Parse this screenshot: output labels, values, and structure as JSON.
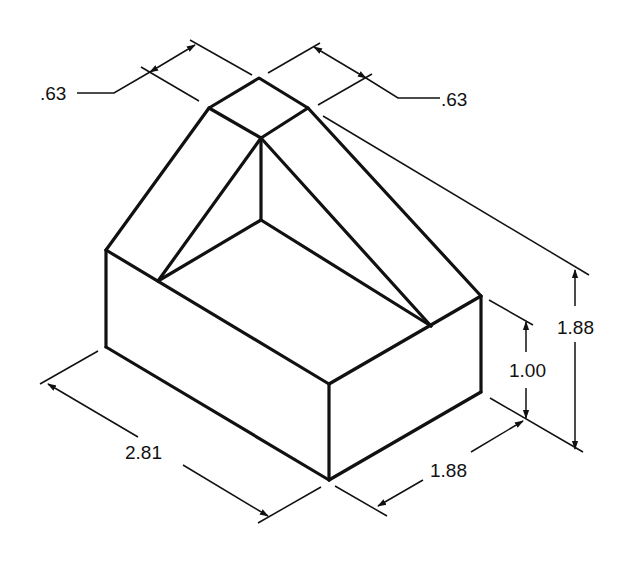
{
  "diagram": {
    "type": "isometric-technical-drawing",
    "line_color": "#111111",
    "background": "#ffffff",
    "dimensions": [
      {
        "id": "top-left-width",
        "label": ".63"
      },
      {
        "id": "top-right-width",
        "label": ".63"
      },
      {
        "id": "overall-height",
        "label": "1.88"
      },
      {
        "id": "base-height",
        "label": "1.00"
      },
      {
        "id": "depth",
        "label": "1.88"
      },
      {
        "id": "length",
        "label": "2.81"
      }
    ]
  }
}
